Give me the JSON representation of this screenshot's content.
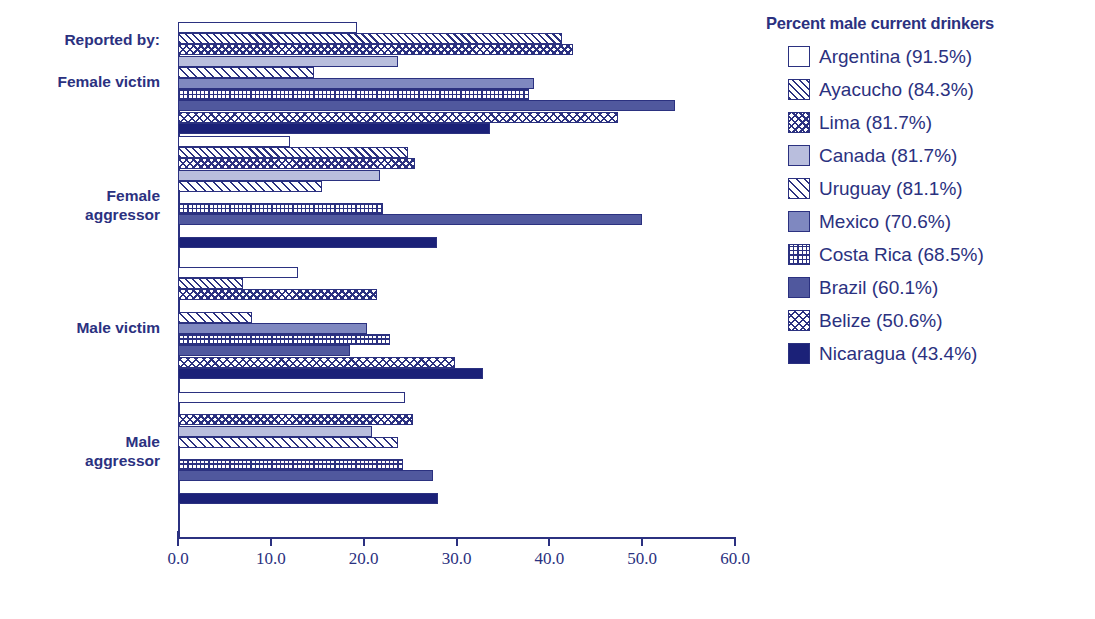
{
  "chart_data": {
    "type": "bar",
    "orientation": "horizontal",
    "title": "",
    "xlabel": "",
    "ylabel": "",
    "xlim": [
      0.0,
      60.0
    ],
    "xticks": [
      "0.0",
      "10.0",
      "20.0",
      "30.0",
      "40.0",
      "50.0",
      "60.0"
    ],
    "grid": false,
    "legend_position": "right",
    "legend_title": "Percent male current drinkers",
    "categories": [
      "Female victim",
      "Female aggressor",
      "Male victim",
      "Male aggressor"
    ],
    "category_axis_note": "Reported by:",
    "series": [
      {
        "name": "Argentina (91.5%)",
        "key": "argentina",
        "pattern": "solid-white",
        "values": [
          19.3,
          12.1,
          12.9,
          24.5
        ]
      },
      {
        "name": "Ayacucho (84.3%)",
        "key": "ayacucho",
        "pattern": "diagonal-hatch",
        "values": [
          41.4,
          24.8,
          7.0,
          0.0
        ]
      },
      {
        "name": "Lima (81.7%)",
        "key": "lima",
        "pattern": "chevron",
        "values": [
          42.6,
          25.5,
          21.4,
          25.3
        ]
      },
      {
        "name": "Canada (81.7%)",
        "key": "canada",
        "pattern": "light-fill",
        "values": [
          23.7,
          21.8,
          0.0,
          20.9
        ]
      },
      {
        "name": "Uruguay (81.1%)",
        "key": "uruguay",
        "pattern": "thin-diagonal",
        "values": [
          14.7,
          15.5,
          8.0,
          23.7
        ]
      },
      {
        "name": "Mexico (70.6%)",
        "key": "mexico",
        "pattern": "medium-fill",
        "values": [
          38.4,
          0.0,
          20.4,
          0.0
        ]
      },
      {
        "name": "Costa Rica (68.5%)",
        "key": "costarica",
        "pattern": "grid-hatch",
        "values": [
          37.8,
          22.1,
          22.8,
          24.2
        ]
      },
      {
        "name": "Brazil (60.1%)",
        "key": "brazil",
        "pattern": "dark-fill",
        "values": [
          53.5,
          50.0,
          18.5,
          27.5
        ]
      },
      {
        "name": "Belize (50.6%)",
        "key": "belize",
        "pattern": "diamond-hatch",
        "values": [
          47.4,
          0.0,
          29.8,
          0.0
        ]
      },
      {
        "name": "Nicaragua (43.4%)",
        "key": "nicaragua",
        "pattern": "navy-fill",
        "values": [
          33.6,
          27.9,
          32.9,
          28.0
        ]
      }
    ]
  },
  "colors": {
    "ink": "#2b3180",
    "navy": "#1b2178",
    "dark_fill": "#50589e",
    "medium_fill": "#7f88c0",
    "light_fill": "#b9bedd",
    "background": "#ffffff"
  }
}
